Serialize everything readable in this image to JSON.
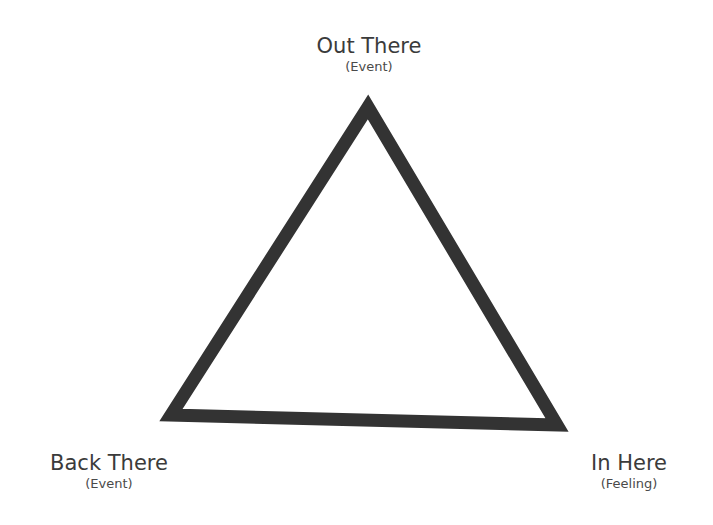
{
  "diagram": {
    "type": "triangle",
    "stroke_color": "#333333",
    "fill_color": "#ffffff",
    "vertices": {
      "top": {
        "label": "Out There",
        "sublabel": "(Event)"
      },
      "bottom_left": {
        "label": "Back There",
        "sublabel": "(Event)"
      },
      "bottom_right": {
        "label": "In Here",
        "sublabel": "(Feeling)"
      }
    }
  }
}
